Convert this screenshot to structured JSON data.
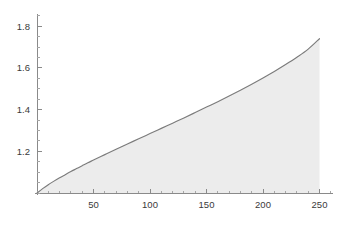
{
  "chart_data": {
    "type": "area",
    "title": "",
    "subtitle": "",
    "xlabel": "",
    "ylabel": "",
    "xlim": [
      0,
      262
    ],
    "ylim": [
      1.0,
      1.875
    ],
    "grid": false,
    "legend": null,
    "baseline": 1.0,
    "x_ticks_major": [
      50,
      100,
      150,
      200,
      250
    ],
    "x_tick_labels": [
      "50",
      "100",
      "150",
      "200",
      "250"
    ],
    "x_ticks_minor_step": 10,
    "y_ticks_major": [
      1.2,
      1.4,
      1.6,
      1.8
    ],
    "y_tick_labels": [
      "1.2",
      "1.4",
      "1.6",
      "1.8"
    ],
    "y_ticks_minor_step": 0.05,
    "series": [
      {
        "name": "curve",
        "line_color": "#7b7b7b",
        "fill_color": "#ececec",
        "x": [
          0,
          5,
          10,
          15,
          20,
          25,
          30,
          35,
          40,
          45,
          50,
          60,
          70,
          80,
          90,
          100,
          110,
          120,
          130,
          140,
          150,
          160,
          170,
          180,
          190,
          200,
          210,
          220,
          230,
          240,
          250
        ],
        "values": [
          1.0,
          1.021,
          1.04,
          1.057,
          1.073,
          1.088,
          1.103,
          1.117,
          1.131,
          1.145,
          1.158,
          1.184,
          1.21,
          1.235,
          1.26,
          1.285,
          1.31,
          1.335,
          1.36,
          1.386,
          1.412,
          1.438,
          1.465,
          1.493,
          1.522,
          1.552,
          1.583,
          1.616,
          1.651,
          1.69,
          1.74
        ]
      }
    ]
  },
  "plot": {
    "origin_px": {
      "x": 37,
      "y": 193
    },
    "x_axis_end_px": 333,
    "y_axis_top_px": 14,
    "px_per_x_unit": 1.13,
    "px_per_y_unit": 208.5,
    "curve_end_px": {
      "x": 322,
      "y": 18
    },
    "background_color": "#ffffff",
    "axis_color": "#8a8a8a",
    "tick_label_color": "#3a3a3a"
  }
}
